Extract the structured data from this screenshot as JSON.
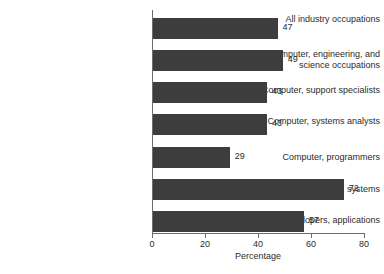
{
  "chart_data": {
    "type": "bar",
    "orientation": "horizontal",
    "title": "",
    "xlabel": "Percentage",
    "ylabel": "",
    "xlim": [
      0,
      80
    ],
    "xticks": [
      0,
      20,
      40,
      60,
      80
    ],
    "xtick_labels": [
      "0",
      "20",
      "40",
      "60",
      "80"
    ],
    "grid": false,
    "legend": false,
    "bar_color": "#3d3d3d",
    "axis_color": "#6d6d6d",
    "text_color": "#2b2b2b",
    "background": "#ffffff",
    "categories": [
      "All industry occupations",
      "Computer, engineering, and science occupations",
      "Computer, support specialists",
      "Computer, systems analysts",
      "Computer, programmers",
      "Software developers, systems",
      "Software developers, applications"
    ],
    "category_label_lines": [
      [
        "All industry occupations"
      ],
      [
        "Computer, engineering, and",
        "science occupations"
      ],
      [
        "Computer, support specialists"
      ],
      [
        "Computer, systems analysts"
      ],
      [
        "Computer, programmers"
      ],
      [
        "Software developers, systems"
      ],
      [
        "Software developers, applications"
      ]
    ],
    "values": [
      47,
      49,
      43,
      43,
      29,
      72,
      57
    ],
    "value_labels": [
      "47",
      "49",
      "43",
      "43",
      "29",
      "72",
      "57"
    ]
  }
}
